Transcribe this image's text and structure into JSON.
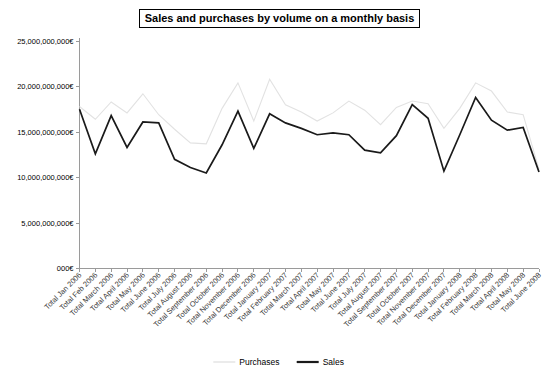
{
  "chart_data": {
    "type": "line",
    "title": "Sales and purchases by volume on a monthly basis",
    "xlabel": "",
    "ylabel": "",
    "ylim": [
      0,
      25000000000
    ],
    "ytick_values": [
      25000000000,
      20000000000,
      15000000000,
      10000000000,
      5000000000,
      0
    ],
    "ytick_labels": [
      "25,000,000,000€",
      "20,000,000,000€",
      "15,000,000,000€",
      "10,000,000,000€",
      "5,000,000,000€",
      "000€"
    ],
    "grid": false,
    "legend_position": "bottom",
    "categories": [
      "Total Jan 2006",
      "Total Feb 2006",
      "Total March 2006",
      "Total April 2006",
      "Total May 2006",
      "Total June 2006",
      "Total July 2006",
      "Total August 2006",
      "Total September 2006",
      "Total October 2006",
      "Total November 2006",
      "Total December 2006",
      "Total January 2007",
      "Total February 2007",
      "Total March 2007",
      "Total April 2007",
      "Total May 2007",
      "Total June 2007",
      "Total July 2007",
      "Total August 2007",
      "Total September 2007",
      "Total October 2007",
      "Total November 2007",
      "Total December 2007",
      "Total January 2008",
      "Total February 2008",
      "Total March 2008",
      "Total April 2008",
      "Total May 2008",
      "Total June 2008"
    ],
    "series": [
      {
        "name": "Purchases",
        "color": "#e2e2e2",
        "values": [
          17800000000,
          16400000000,
          18300000000,
          17100000000,
          19200000000,
          16900000000,
          15300000000,
          13800000000,
          13700000000,
          17600000000,
          20400000000,
          16200000000,
          20800000000,
          18000000000,
          17200000000,
          16200000000,
          17100000000,
          18400000000,
          17400000000,
          15800000000,
          17700000000,
          18400000000,
          18100000000,
          15400000000,
          17600000000,
          20400000000,
          19500000000,
          17200000000,
          16900000000,
          10900000000
        ]
      },
      {
        "name": "Sales",
        "color": "#1a1a1a",
        "values": [
          17500000000,
          12600000000,
          16800000000,
          13300000000,
          16100000000,
          16000000000,
          12000000000,
          11100000000,
          10500000000,
          13600000000,
          17300000000,
          13200000000,
          17000000000,
          16000000000,
          15400000000,
          14700000000,
          14900000000,
          14700000000,
          13000000000,
          12700000000,
          14600000000,
          18000000000,
          16500000000,
          10700000000,
          14700000000,
          18800000000,
          16300000000,
          15200000000,
          15500000000,
          10600000000
        ]
      }
    ]
  },
  "legend": {
    "items": [
      {
        "label": "Purchases",
        "color": "#e2e2e2"
      },
      {
        "label": "Sales",
        "color": "#1a1a1a"
      }
    ]
  }
}
